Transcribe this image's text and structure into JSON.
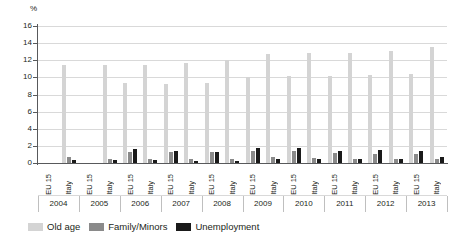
{
  "chart_data": {
    "type": "bar",
    "title": "",
    "subtitle": "",
    "xlabel": "",
    "ylabel": "%",
    "ylim": [
      0,
      16
    ],
    "yticks": [
      0,
      2,
      4,
      6,
      8,
      10,
      12,
      14,
      16
    ],
    "grid": true,
    "legend_position": "bottom-left",
    "group_levels": {
      "years": [
        "2004",
        "2005",
        "2006",
        "2007",
        "2008",
        "2009",
        "2010",
        "2011",
        "2012",
        "2013"
      ],
      "regions": [
        "EU 15",
        "Italy"
      ]
    },
    "categories": [
      "2004 EU 15",
      "2004 Italy",
      "2005 EU 15",
      "2005 Italy",
      "2006 EU 15",
      "2006 Italy",
      "2007 EU 15",
      "2007 Italy",
      "2008 EU 15",
      "2008 Italy",
      "2009 EU 15",
      "2009 Italy",
      "2010 EU 15",
      "2010 Italy",
      "2011 EU 15",
      "2011 Italy",
      "2012 EU 15",
      "2012 Italy",
      "2013 EU 15",
      "2013 Italy"
    ],
    "series": [
      {
        "name": "Old age",
        "color": "#d4d4d4",
        "values": [
          0,
          11.4,
          0,
          11.5,
          9.3,
          11.4,
          9.2,
          11.7,
          9.4,
          12.0,
          10.1,
          12.7,
          10.2,
          12.9,
          10.2,
          12.8,
          10.3,
          13.1,
          10.4,
          13.5
        ]
      },
      {
        "name": "Family/Minors",
        "color": "#8a8a8a",
        "values": [
          0,
          0.7,
          0,
          0.5,
          1.3,
          0.5,
          1.25,
          0.5,
          1.3,
          0.5,
          1.4,
          0.7,
          1.45,
          0.55,
          1.2,
          0.5,
          1.1,
          0.45,
          1.1,
          0.45
        ]
      },
      {
        "name": "Unemployment",
        "color": "#1a1a1a",
        "values": [
          0,
          0.35,
          0,
          0.3,
          1.6,
          0.35,
          1.4,
          0.25,
          1.3,
          0.25,
          1.7,
          0.45,
          1.75,
          0.5,
          1.4,
          0.45,
          1.5,
          0.45,
          1.45,
          0.65
        ]
      }
    ]
  },
  "axis": {
    "unit_label": "%"
  },
  "legend": {
    "items": [
      {
        "label": "Old age",
        "color": "#d4d4d4"
      },
      {
        "label": "Family/Minors",
        "color": "#8a8a8a"
      },
      {
        "label": "Unemployment",
        "color": "#1a1a1a"
      }
    ]
  }
}
